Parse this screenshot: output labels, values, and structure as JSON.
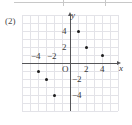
{
  "item": {
    "number_label": "(2)"
  },
  "axes": {
    "x_name": "x",
    "y_name": "y",
    "origin_label": "O"
  },
  "chart_data": {
    "type": "scatter",
    "title": "",
    "xlabel": "x",
    "ylabel": "y",
    "xlim": [
      -6,
      6
    ],
    "ylim": [
      -6,
      6
    ],
    "grid": true,
    "legend": null,
    "x_tick_labels": [
      "−4",
      "−2",
      "2",
      "4"
    ],
    "x_tick_values": [
      -4,
      -2,
      2,
      4
    ],
    "y_tick_labels": [
      "4",
      "2",
      "−2",
      "−4"
    ],
    "y_tick_values": [
      4,
      2,
      -2,
      -4
    ],
    "points": [
      {
        "x": 1,
        "y": 4,
        "label": "(1, 4)"
      },
      {
        "x": 2,
        "y": 2,
        "label": "(2, 2)"
      },
      {
        "x": 4,
        "y": 1,
        "label": "(4, 1)"
      },
      {
        "x": -4,
        "y": -1,
        "label": "(−4, −1)"
      },
      {
        "x": -3,
        "y": -2,
        "label": "(−3, −2)"
      },
      {
        "x": -2,
        "y": -4,
        "label": "(−2, −4)"
      }
    ]
  }
}
